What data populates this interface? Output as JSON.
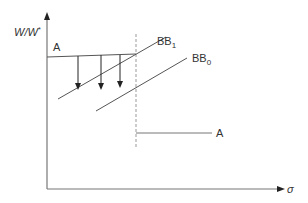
{
  "diagram": {
    "y_axis_label_main": "W/W",
    "y_axis_label_sup": "*",
    "x_axis_label": "σ",
    "upper_line_label": "A",
    "lower_line_label": "A",
    "curve_bb1_label_main": "BB",
    "curve_bb1_label_sub": "1",
    "curve_bb0_label_main": "BB",
    "curve_bb0_label_sub": "0",
    "colors": {
      "axis": "#666666",
      "line": "#555555",
      "dashed": "#999999",
      "arrow": "#222222",
      "text": "#333333"
    }
  }
}
